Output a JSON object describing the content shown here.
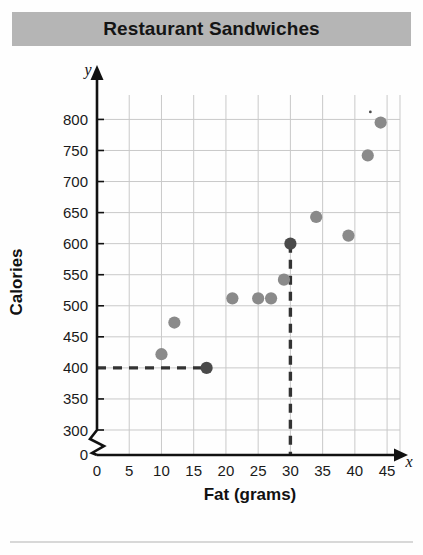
{
  "title": "Restaurant Sandwiches",
  "colors": {
    "banner": "#b5b5b5",
    "point": "#8a8a8a",
    "point_highlight": "#4a4a4a",
    "grid": "#c9c9c9",
    "axis": "#111111",
    "dashed": "#333333"
  },
  "axes": {
    "y_label": "Calories",
    "y_variable": "y",
    "y_ticks": [
      "0",
      "300",
      "350",
      "400",
      "450",
      "500",
      "550",
      "600",
      "650",
      "700",
      "750",
      "800"
    ],
    "y_break": true,
    "x_label": "Fat (grams)",
    "x_variable": "x",
    "x_ticks": [
      "0",
      "5",
      "10",
      "15",
      "20",
      "25",
      "30",
      "35",
      "40",
      "45"
    ]
  },
  "chart_data": {
    "type": "scatter",
    "title": "Restaurant Sandwiches",
    "xlabel": "Fat (grams)",
    "ylabel": "Calories",
    "xlim": [
      0,
      47
    ],
    "ylim": [
      300,
      820
    ],
    "y_axis_break_below": 300,
    "grid": true,
    "legend": "none",
    "points": [
      {
        "x": 10,
        "y": 422,
        "highlight": false
      },
      {
        "x": 12,
        "y": 473,
        "highlight": false
      },
      {
        "x": 17,
        "y": 400,
        "highlight": true
      },
      {
        "x": 21,
        "y": 512,
        "highlight": false
      },
      {
        "x": 25,
        "y": 512,
        "highlight": false
      },
      {
        "x": 27,
        "y": 512,
        "highlight": false
      },
      {
        "x": 29,
        "y": 542,
        "highlight": false
      },
      {
        "x": 30,
        "y": 600,
        "highlight": true
      },
      {
        "x": 34,
        "y": 643,
        "highlight": false
      },
      {
        "x": 39,
        "y": 613,
        "highlight": false
      },
      {
        "x": 42,
        "y": 742,
        "highlight": false
      },
      {
        "x": 44,
        "y": 795,
        "highlight": false
      }
    ],
    "reference_lines": [
      {
        "orientation": "horizontal",
        "value": 400,
        "from_x": 0,
        "to_x": 17,
        "style": "dashed"
      },
      {
        "orientation": "vertical",
        "value": 30,
        "from_y": 300,
        "to_y": 600,
        "style": "dashed"
      }
    ]
  }
}
